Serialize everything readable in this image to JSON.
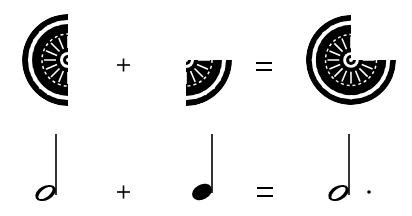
{
  "diagram": {
    "colors": {
      "ink": "#000000",
      "background": "#ffffff"
    },
    "row_pie": {
      "terms": [
        {
          "name": "half-circle",
          "fraction": "1/2"
        },
        {
          "name": "quarter-circle",
          "fraction": "1/4"
        },
        {
          "name": "three-quarter-circle",
          "fraction": "3/4"
        }
      ],
      "operators": [
        "+",
        "="
      ]
    },
    "row_notes": {
      "terms": [
        {
          "name": "half-note",
          "value": "1/2"
        },
        {
          "name": "quarter-note",
          "value": "1/4"
        },
        {
          "name": "dotted-half-note",
          "value": "3/4"
        }
      ],
      "operators": [
        "+",
        "="
      ]
    }
  }
}
